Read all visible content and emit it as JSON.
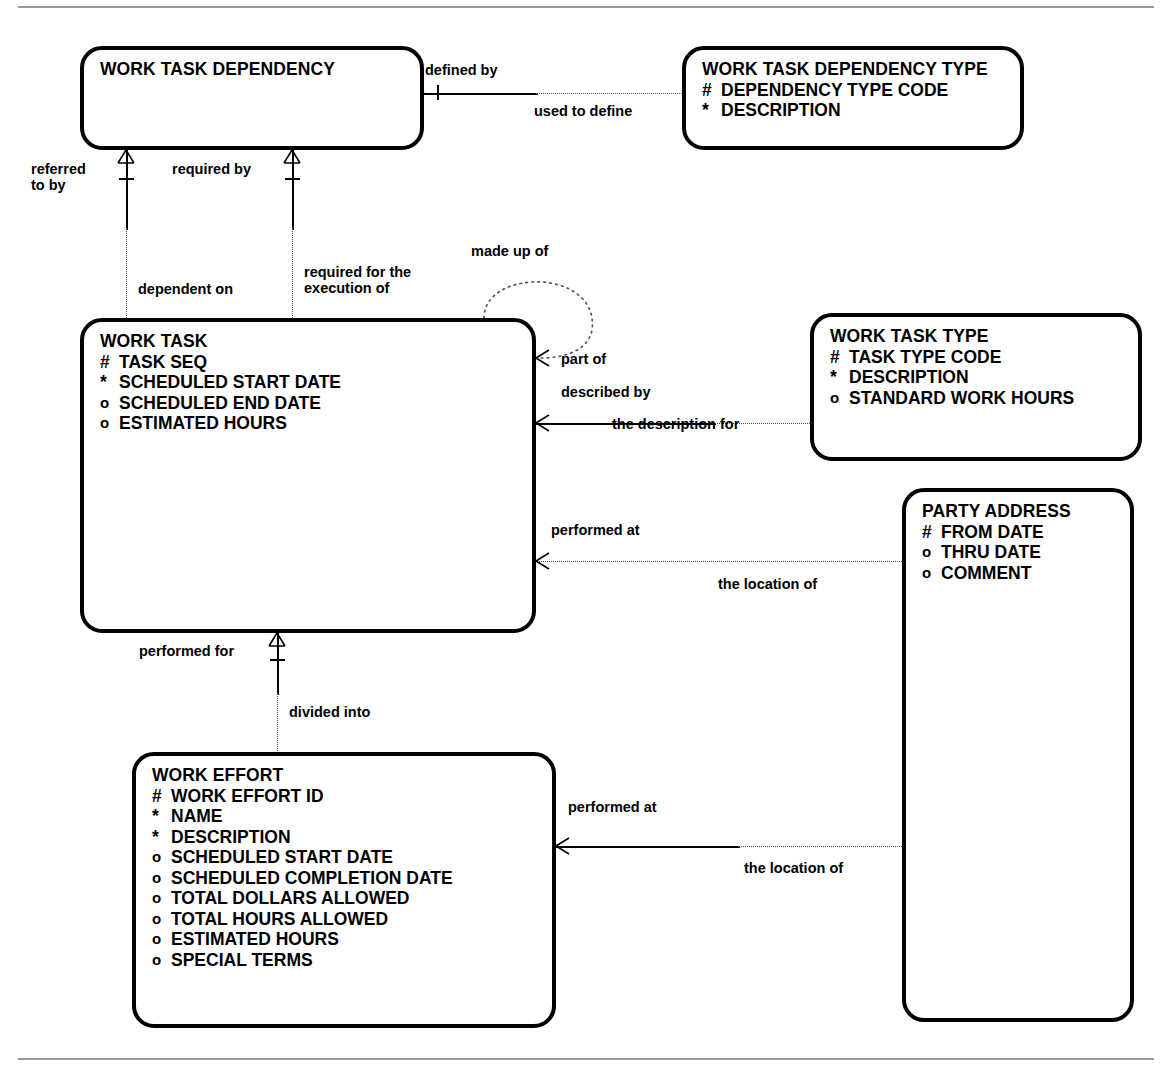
{
  "diagram": {
    "type": "entity-relationship-diagram",
    "notation": "barker",
    "entities": [
      {
        "id": "work-task-dependency",
        "name": "WORK TASK DEPENDENCY",
        "attributes": []
      },
      {
        "id": "work-task-dependency-type",
        "name": "WORK TASK DEPENDENCY TYPE",
        "attributes": [
          {
            "mark": "#",
            "name": "DEPENDENCY TYPE CODE"
          },
          {
            "mark": "*",
            "name": "DESCRIPTION"
          }
        ]
      },
      {
        "id": "work-task",
        "name": "WORK TASK",
        "attributes": [
          {
            "mark": "#",
            "name": "TASK SEQ"
          },
          {
            "mark": "*",
            "name": "SCHEDULED START DATE"
          },
          {
            "mark": "o",
            "name": "SCHEDULED END DATE"
          },
          {
            "mark": "o",
            "name": "ESTIMATED HOURS"
          }
        ]
      },
      {
        "id": "work-task-type",
        "name": "WORK TASK TYPE",
        "attributes": [
          {
            "mark": "#",
            "name": "TASK TYPE CODE"
          },
          {
            "mark": "*",
            "name": "DESCRIPTION"
          },
          {
            "mark": "o",
            "name": "STANDARD WORK HOURS"
          }
        ]
      },
      {
        "id": "party-address",
        "name": "PARTY ADDRESS",
        "attributes": [
          {
            "mark": "#",
            "name": "FROM DATE"
          },
          {
            "mark": "o",
            "name": "THRU DATE"
          },
          {
            "mark": "o",
            "name": "COMMENT"
          }
        ]
      },
      {
        "id": "work-effort",
        "name": "WORK EFFORT",
        "attributes": [
          {
            "mark": "#",
            "name": "WORK EFFORT ID"
          },
          {
            "mark": "*",
            "name": "NAME"
          },
          {
            "mark": "*",
            "name": "DESCRIPTION"
          },
          {
            "mark": "o",
            "name": "SCHEDULED START DATE"
          },
          {
            "mark": "o",
            "name": "SCHEDULED COMPLETION DATE"
          },
          {
            "mark": "o",
            "name": "TOTAL DOLLARS ALLOWED"
          },
          {
            "mark": "o",
            "name": "TOTAL HOURS ALLOWED"
          },
          {
            "mark": "o",
            "name": "ESTIMATED HOURS"
          },
          {
            "mark": "o",
            "name": "SPECIAL TERMS"
          }
        ]
      }
    ],
    "relationships": [
      {
        "id": "defined-by",
        "label": "defined by"
      },
      {
        "id": "used-to-define",
        "label": "used to define"
      },
      {
        "id": "referred-to-by",
        "label": "referred\nto by"
      },
      {
        "id": "required-by",
        "label": "required by"
      },
      {
        "id": "dependent-on",
        "label": "dependent on"
      },
      {
        "id": "required-for-execution",
        "label": "required for the\nexecution of"
      },
      {
        "id": "made-up-of",
        "label": "made up of"
      },
      {
        "id": "part-of",
        "label": "part of"
      },
      {
        "id": "described-by",
        "label": "described by"
      },
      {
        "id": "the-description-for",
        "label": "the description for"
      },
      {
        "id": "performed-at-task",
        "label": "performed at"
      },
      {
        "id": "the-location-of-task",
        "label": "the location of"
      },
      {
        "id": "performed-for",
        "label": "performed for"
      },
      {
        "id": "divided-into",
        "label": "divided into"
      },
      {
        "id": "performed-at-effort",
        "label": "performed at"
      },
      {
        "id": "the-location-of-effort",
        "label": "the location of"
      }
    ]
  }
}
